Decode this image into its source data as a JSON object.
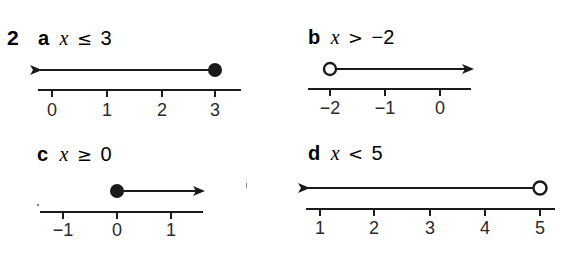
{
  "question_number": "2",
  "parts": [
    {
      "letter": "a",
      "variable": "x",
      "relation": "≤",
      "bound": "3",
      "inequality_text": "x ≤ 3",
      "endpoint": "closed",
      "direction": "left",
      "ticks": [
        "0",
        "1",
        "2",
        "3"
      ],
      "endpoint_value": 3
    },
    {
      "letter": "b",
      "variable": "x",
      "relation": ">",
      "bound": "−2",
      "inequality_text": "x > −2",
      "endpoint": "open",
      "direction": "right",
      "ticks": [
        "−2",
        "−1",
        "0"
      ],
      "endpoint_value": -2
    },
    {
      "letter": "c",
      "variable": "x",
      "relation": "≥",
      "bound": "0",
      "inequality_text": "x ≥ 0",
      "endpoint": "closed",
      "direction": "right",
      "ticks": [
        "−1",
        "0",
        "1"
      ],
      "endpoint_value": 0
    },
    {
      "letter": "d",
      "variable": "x",
      "relation": "<",
      "bound": "5",
      "inequality_text": "x < 5",
      "endpoint": "open",
      "direction": "left",
      "ticks": [
        "1",
        "2",
        "3",
        "4",
        "5"
      ],
      "endpoint_value": 5
    }
  ],
  "colors": {
    "ink": "#1a1a1a",
    "background": "#ffffff"
  }
}
